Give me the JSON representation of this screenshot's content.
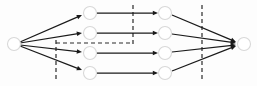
{
  "figure": {
    "kind": "layered-network-flow-diagram",
    "width": 257,
    "height": 86,
    "background_color": "#fdfdfd",
    "edge_color": "#1a1a1a",
    "node_fill_color": "#ffffff",
    "node_stroke_color": "#d8d8d8",
    "cut_line_color": "#2a2a2a",
    "caption": ""
  },
  "nodes": [
    {
      "id": "source",
      "label": "",
      "cx": 14,
      "cy": 44,
      "r": 6.5,
      "layer": 0
    },
    {
      "id": "m1-1",
      "label": "",
      "cx": 90,
      "cy": 13,
      "r": 6.5,
      "layer": 1
    },
    {
      "id": "m1-2",
      "label": "",
      "cx": 90,
      "cy": 33,
      "r": 6.5,
      "layer": 1
    },
    {
      "id": "m1-3",
      "label": "",
      "cx": 90,
      "cy": 53,
      "r": 6.5,
      "layer": 1
    },
    {
      "id": "m1-4",
      "label": "",
      "cx": 90,
      "cy": 73,
      "r": 6.5,
      "layer": 1
    },
    {
      "id": "m2-1",
      "label": "",
      "cx": 165,
      "cy": 13,
      "r": 6.5,
      "layer": 2
    },
    {
      "id": "m2-2",
      "label": "",
      "cx": 165,
      "cy": 33,
      "r": 6.5,
      "layer": 2
    },
    {
      "id": "m2-3",
      "label": "",
      "cx": 165,
      "cy": 53,
      "r": 6.5,
      "layer": 2
    },
    {
      "id": "m2-4",
      "label": "",
      "cx": 165,
      "cy": 73,
      "r": 6.5,
      "layer": 2
    },
    {
      "id": "sink",
      "label": "",
      "cx": 244,
      "cy": 44,
      "r": 6.5,
      "layer": 3
    }
  ],
  "edges": [
    {
      "from": "source",
      "to": "m1-1",
      "x1": 20,
      "y1": 42,
      "x2": 82,
      "y2": 15,
      "arrow": true
    },
    {
      "from": "source",
      "to": "m1-2",
      "x1": 20,
      "y1": 43,
      "x2": 82,
      "y2": 33,
      "arrow": true
    },
    {
      "from": "source",
      "to": "m1-3",
      "x1": 20,
      "y1": 45,
      "x2": 82,
      "y2": 52,
      "arrow": true
    },
    {
      "from": "source",
      "to": "m1-4",
      "x1": 20,
      "y1": 46,
      "x2": 82,
      "y2": 70,
      "arrow": true
    },
    {
      "from": "m1-1",
      "to": "m2-1",
      "x1": 97,
      "y1": 13,
      "x2": 158,
      "y2": 13,
      "arrow": true
    },
    {
      "from": "m1-2",
      "to": "m2-2",
      "x1": 97,
      "y1": 33,
      "x2": 158,
      "y2": 33,
      "arrow": true
    },
    {
      "from": "m1-3",
      "to": "m2-3",
      "x1": 97,
      "y1": 53,
      "x2": 158,
      "y2": 53,
      "arrow": true
    },
    {
      "from": "m1-4",
      "to": "m2-4",
      "x1": 97,
      "y1": 73,
      "x2": 158,
      "y2": 73,
      "arrow": true
    },
    {
      "from": "m2-1",
      "to": "sink",
      "x1": 172,
      "y1": 15,
      "x2": 236,
      "y2": 42,
      "arrow": true
    },
    {
      "from": "m2-2",
      "to": "sink",
      "x1": 172,
      "y1": 34,
      "x2": 236,
      "y2": 43,
      "arrow": true
    },
    {
      "from": "m2-3",
      "to": "sink",
      "x1": 172,
      "y1": 52,
      "x2": 236,
      "y2": 45,
      "arrow": true
    },
    {
      "from": "m2-4",
      "to": "sink",
      "x1": 172,
      "y1": 71,
      "x2": 236,
      "y2": 46,
      "arrow": true
    }
  ],
  "cut_lines": [
    {
      "id": "cut-1",
      "orientation": "vertical",
      "x1": 56,
      "y1": 40,
      "x2": 56,
      "y2": 81
    },
    {
      "id": "cut-2",
      "orientation": "horizontal",
      "x1": 56,
      "y1": 43,
      "x2": 133,
      "y2": 43
    },
    {
      "id": "cut-3",
      "orientation": "vertical",
      "x1": 133,
      "y1": 5,
      "x2": 133,
      "y2": 45
    },
    {
      "id": "cut-4",
      "orientation": "vertical",
      "x1": 202,
      "y1": 5,
      "x2": 202,
      "y2": 81
    }
  ]
}
